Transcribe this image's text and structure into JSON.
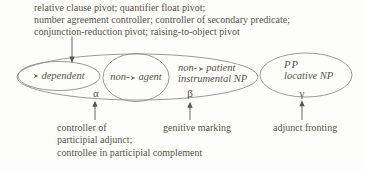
{
  "top_note": {
    "line1": "relative clause pivot; quantifier float pivot;",
    "line2": "number agreement controller; controller of secondary predicate;",
    "line3": "conjunction-reduction pivot; raising-to-object pivot"
  },
  "ellipse_labels": {
    "dependent": {
      "prefix": "",
      "word": "dependent"
    },
    "agent": {
      "prefix": "non-",
      "word": "agent"
    },
    "patient": {
      "prefix": "non-",
      "word": "patient",
      "line2": "instrumental NP"
    },
    "pp": {
      "line1": "PP",
      "line2": "locative NP"
    }
  },
  "zone_markers": {
    "alpha": "α",
    "beta": "β",
    "gamma": "γ"
  },
  "bottom_notes": {
    "alpha_line1": "controller of",
    "alpha_line2": "participial adjunct;",
    "alpha_line3": "controllee in participial complement",
    "beta": "genitive marking",
    "gamma": "adjunct fronting"
  },
  "icons": {
    "role_pointer": "right-arrowhead"
  },
  "colors": {
    "background": "#fdfdfa",
    "text": "#56524b",
    "ellipse_line": "#8f8f8f",
    "arrow": "#55524c"
  }
}
